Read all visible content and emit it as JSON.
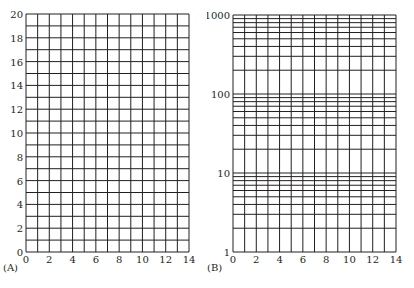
{
  "chart_data": [
    {
      "panel": "(A)",
      "type": "grid",
      "title": "",
      "xlabel": "",
      "ylabel": "",
      "xscale": "linear",
      "yscale": "linear",
      "xlim": [
        0,
        14
      ],
      "ylim": [
        0,
        20
      ],
      "x_ticks": [
        0,
        2,
        4,
        6,
        8,
        10,
        12,
        14
      ],
      "y_ticks": [
        0,
        2,
        4,
        6,
        8,
        10,
        12,
        14,
        16,
        18,
        20
      ],
      "x_grid_step": 1,
      "y_grid_step": 1,
      "grid": true,
      "series": []
    },
    {
      "panel": "(B)",
      "type": "grid",
      "title": "",
      "xlabel": "",
      "ylabel": "",
      "xscale": "linear",
      "yscale": "log",
      "xlim": [
        0,
        14
      ],
      "ylim": [
        1,
        1000
      ],
      "x_ticks": [
        0,
        2,
        4,
        6,
        8,
        10,
        12,
        14
      ],
      "y_ticks": [
        1,
        10,
        100,
        1000
      ],
      "x_grid_step": 1,
      "y_grid": "log minor lines at 2-9 per decade",
      "grid": true,
      "series": []
    }
  ],
  "panels": {
    "a": {
      "label": "(A)",
      "x_ticks": [
        "0",
        "2",
        "4",
        "6",
        "8",
        "10",
        "12",
        "14"
      ],
      "y_ticks": [
        "0",
        "2",
        "4",
        "6",
        "8",
        "10",
        "12",
        "14",
        "16",
        "18",
        "20"
      ]
    },
    "b": {
      "label": "(B)",
      "x_ticks": [
        "0",
        "2",
        "4",
        "6",
        "8",
        "10",
        "12",
        "14"
      ],
      "y_ticks": [
        "1",
        "10",
        "100",
        "1000"
      ]
    }
  },
  "colors": {
    "grid": "#231f20",
    "background": "#ffffff"
  }
}
